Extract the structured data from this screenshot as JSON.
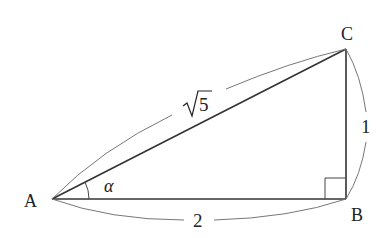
{
  "diagram": {
    "vertices": {
      "A": {
        "label": "A",
        "x": 52,
        "y": 199
      },
      "B": {
        "label": "B",
        "x": 346,
        "y": 199
      },
      "C": {
        "label": "C",
        "x": 346,
        "y": 49
      }
    },
    "sides": {
      "AC": {
        "label": "5",
        "radical": true,
        "display": "√5"
      },
      "BC": {
        "label": "1"
      },
      "AB": {
        "label": "2"
      }
    },
    "angle": {
      "vertex": "A",
      "label": "α"
    },
    "right_angle_at": "B",
    "colors": {
      "stroke": "#333333",
      "brace": "#666666",
      "text": "#222222"
    }
  }
}
